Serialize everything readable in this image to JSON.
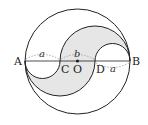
{
  "diagram": {
    "points": {
      "A": "A",
      "B": "B",
      "C": "C",
      "D": "D",
      "O": "O"
    },
    "segments": {
      "AC": "a",
      "CD": "b",
      "DB": "a"
    },
    "colors": {
      "stroke": "#222222",
      "shade": "#e6e6e6",
      "dotted": "#999999"
    }
  }
}
